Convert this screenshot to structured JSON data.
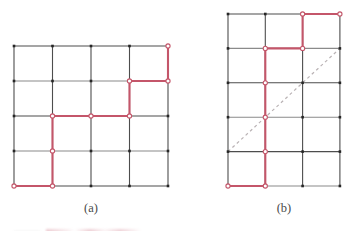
{
  "figure": {
    "background_color": "#ffffff",
    "grid_line_color": "#4d4d4d",
    "grid_line_color_light": "#8a8a8a",
    "node_color": "#262626",
    "path_color": "#c4566a",
    "path_node_fill": "#ffffff",
    "diagonal_color": "#b9b2b4",
    "caption_color": "#4a4a4a"
  },
  "panels": [
    {
      "id": "a",
      "caption": "(a)",
      "caption_x": 91,
      "caption_y": 212,
      "origin_x": 14,
      "origin_y": 46,
      "cell_w": 38.5,
      "cell_h": 35,
      "cols": 4,
      "rows": 4,
      "node_style": "square",
      "path_points": [
        [
          4,
          0
        ],
        [
          4,
          1
        ],
        [
          3,
          1
        ],
        [
          3,
          2
        ],
        [
          1,
          2
        ],
        [
          1,
          4
        ],
        [
          0,
          4
        ]
      ],
      "path_vertex_markers": [
        [
          4,
          0
        ],
        [
          4,
          1
        ],
        [
          3,
          1
        ],
        [
          3,
          2
        ],
        [
          2,
          2
        ],
        [
          1,
          2
        ],
        [
          1,
          3
        ],
        [
          1,
          4
        ],
        [
          0,
          4
        ]
      ],
      "has_diagonal": false,
      "diagonal": null
    },
    {
      "id": "b",
      "caption": "(b)",
      "caption_x": 284,
      "caption_y": 212,
      "origin_x": 228,
      "origin_y": 14,
      "cell_w": 37.3,
      "cell_h": 34.4,
      "cols": 3,
      "rows": 5,
      "node_style": "square",
      "path_points": [
        [
          3,
          0
        ],
        [
          2,
          0
        ],
        [
          2,
          1
        ],
        [
          1,
          1
        ],
        [
          1,
          5
        ],
        [
          0,
          5
        ]
      ],
      "path_vertex_markers": [
        [
          3,
          0
        ],
        [
          2,
          0
        ],
        [
          2,
          1
        ],
        [
          1,
          1
        ],
        [
          1,
          2
        ],
        [
          1,
          3
        ],
        [
          1,
          4
        ],
        [
          1,
          5
        ],
        [
          0,
          5
        ]
      ],
      "has_diagonal": true,
      "diagonal": {
        "from": [
          0,
          4
        ],
        "to": [
          3,
          1
        ],
        "style": "dashed",
        "dash_pattern": "3 3"
      }
    }
  ]
}
